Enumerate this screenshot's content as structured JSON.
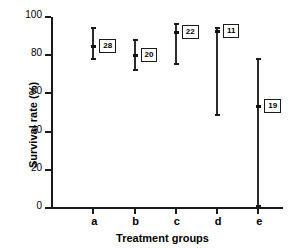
{
  "chart_data": {
    "type": "scatter",
    "title": "",
    "xlabel": "Treatment groups",
    "ylabel": "Survival rate (%)",
    "categories": [
      "a",
      "b",
      "c",
      "d",
      "e"
    ],
    "ylim": [
      0,
      100
    ],
    "yticks": [
      0,
      20,
      40,
      60,
      80,
      100
    ],
    "ytick_labels": [
      "0",
      "20",
      "40",
      "60",
      "80",
      "100"
    ],
    "grid": false,
    "legend": "none",
    "series": [
      {
        "name": "Survival rate with range",
        "points": [
          {
            "category": "a",
            "mean": 85,
            "low": 78,
            "high": 94,
            "n_label": "28"
          },
          {
            "category": "b",
            "mean": 80,
            "low": 72,
            "high": 88,
            "n_label": "20"
          },
          {
            "category": "c",
            "mean": 92,
            "low": 75.5,
            "high": 96.5,
            "n_label": "22"
          },
          {
            "category": "d",
            "mean": 92.5,
            "low": 48.5,
            "high": 94,
            "n_label": "11"
          },
          {
            "category": "e",
            "mean": 53.5,
            "low": 1,
            "high": 78,
            "n_label": "19"
          }
        ]
      }
    ],
    "annotations": [
      {
        "text": "28",
        "category": "a"
      },
      {
        "text": "20",
        "category": "b"
      },
      {
        "text": "22",
        "category": "c"
      },
      {
        "text": "11",
        "category": "d"
      },
      {
        "text": "19",
        "category": "e"
      }
    ],
    "colors": {
      "axis": "#1a1a1a",
      "marker": "#2b2b2b",
      "background": "#ffffff"
    }
  }
}
